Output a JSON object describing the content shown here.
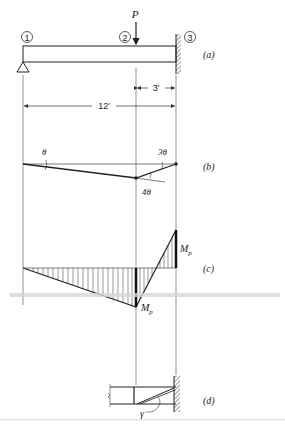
{
  "nodes": [
    {
      "id": "1",
      "label": "1"
    },
    {
      "id": "2",
      "label": "2"
    },
    {
      "id": "3",
      "label": "3"
    }
  ],
  "load": {
    "label": "P"
  },
  "dimensions": {
    "short_span": "3'",
    "total_span": "12'"
  },
  "panels": {
    "a": "(a)",
    "b": "(b)",
    "c": "(c)",
    "d": "(d)"
  },
  "mechanism": {
    "rotation_left": "θ",
    "rotation_right": "3θ",
    "rotation_hinge": "4θ"
  },
  "moment_diagram": {
    "mp_top": "M",
    "mp_top_sub": "p",
    "mp_bottom": "M",
    "mp_bottom_sub": "p"
  },
  "detail": {
    "angle_label": "γ"
  },
  "colors": {
    "ink": "#222222",
    "guide": "#555555",
    "band": "#c8c8c8"
  }
}
